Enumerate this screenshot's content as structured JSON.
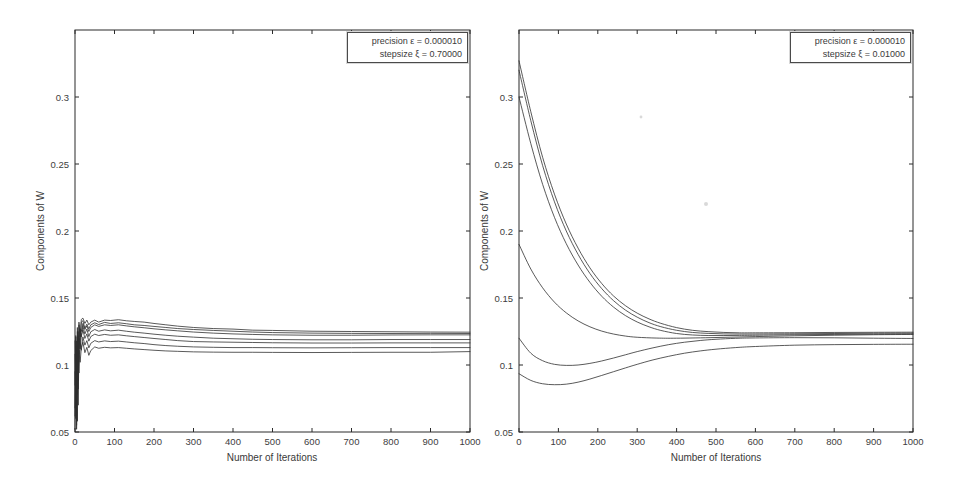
{
  "figure": {
    "background": "#ffffff",
    "colors": {
      "line": "#2e2e2e",
      "frame": "#2b2b2b",
      "text": "#3a3a3a",
      "legend_border": "#4a4a4a"
    },
    "scan_specks": [
      {
        "x": 641,
        "y": 117,
        "r": 1.4
      },
      {
        "x": 706,
        "y": 204,
        "r": 2.0
      }
    ]
  },
  "chart_data": [
    {
      "type": "line",
      "title": "",
      "xlabel": "Number of Iterations",
      "ylabel": "Components of W",
      "xlim": [
        0,
        1000
      ],
      "ylim": [
        0.05,
        0.35
      ],
      "grid": false,
      "smooth": false,
      "legend_position": "top-right",
      "legend_lines": [
        "precision ε = 0.000010",
        "stepsize ξ = 0.70000"
      ],
      "xticks": [
        0,
        100,
        200,
        300,
        400,
        500,
        600,
        700,
        800,
        900,
        1000
      ],
      "yticks": [
        0.05,
        0.1,
        0.15,
        0.2,
        0.25,
        0.3
      ],
      "ytick_labels": [
        "0.05",
        "0.1",
        "0.15",
        "0.2",
        "0.25",
        "0.3"
      ],
      "series_x": [
        0,
        2,
        4,
        6,
        8,
        10,
        13,
        16,
        20,
        25,
        30,
        35,
        40,
        50,
        60,
        75,
        90,
        110,
        130,
        150,
        175,
        200,
        230,
        260,
        300,
        350,
        400,
        450,
        500,
        600,
        700,
        800,
        900,
        1000
      ],
      "series": [
        {
          "name": "w1",
          "values": [
            0.068,
            0.122,
            0.055,
            0.128,
            0.096,
            0.132,
            0.121,
            0.134,
            0.135,
            0.131,
            0.1335,
            0.13,
            0.132,
            0.1335,
            0.132,
            0.1335,
            0.1332,
            0.1338,
            0.133,
            0.1325,
            0.132,
            0.131,
            0.13,
            0.129,
            0.128,
            0.1272,
            0.1268,
            0.126,
            0.1258,
            0.1252,
            0.125,
            0.1248,
            0.1246,
            0.1245
          ]
        },
        {
          "name": "w2",
          "values": [
            0.052,
            0.114,
            0.07,
            0.125,
            0.088,
            0.13,
            0.117,
            0.132,
            0.133,
            0.1275,
            0.1305,
            0.127,
            0.13,
            0.1315,
            0.1302,
            0.1318,
            0.131,
            0.1315,
            0.1308,
            0.13,
            0.1295,
            0.1288,
            0.128,
            0.1272,
            0.1265,
            0.1258,
            0.1252,
            0.1246,
            0.1242,
            0.1238,
            0.1236,
            0.1235,
            0.1236,
            0.1235
          ]
        },
        {
          "name": "w3",
          "values": [
            0.095,
            0.06,
            0.11,
            0.078,
            0.122,
            0.108,
            0.127,
            0.125,
            0.131,
            0.1265,
            0.1292,
            0.125,
            0.128,
            0.13,
            0.1288,
            0.13,
            0.1295,
            0.13,
            0.1292,
            0.1285,
            0.1278,
            0.127,
            0.1262,
            0.1255,
            0.1246,
            0.1238,
            0.1232,
            0.1228,
            0.1225,
            0.1222,
            0.1222,
            0.1224,
            0.1225,
            0.1225
          ]
        },
        {
          "name": "w4",
          "values": [
            0.108,
            0.076,
            0.118,
            0.088,
            0.125,
            0.112,
            0.126,
            0.121,
            0.129,
            0.1232,
            0.1268,
            0.1212,
            0.1248,
            0.1265,
            0.1252,
            0.1262,
            0.1255,
            0.126,
            0.1252,
            0.1245,
            0.1238,
            0.123,
            0.1222,
            0.1215,
            0.1208,
            0.12,
            0.1196,
            0.1192,
            0.119,
            0.1188,
            0.1188,
            0.119,
            0.119,
            0.119
          ]
        },
        {
          "name": "w5",
          "values": [
            0.085,
            0.121,
            0.062,
            0.115,
            0.082,
            0.12,
            0.112,
            0.122,
            0.1262,
            0.1198,
            0.1232,
            0.1178,
            0.1212,
            0.123,
            0.122,
            0.1228,
            0.1222,
            0.1225,
            0.1218,
            0.1212,
            0.1205,
            0.1198,
            0.119,
            0.1182,
            0.1175,
            0.1172,
            0.117,
            0.1168,
            0.1166,
            0.1164,
            0.1164,
            0.1165,
            0.1165,
            0.1165
          ]
        },
        {
          "name": "w6",
          "values": [
            0.118,
            0.068,
            0.112,
            0.058,
            0.108,
            0.094,
            0.117,
            0.111,
            0.121,
            0.1148,
            0.1182,
            0.1128,
            0.1162,
            0.1182,
            0.1172,
            0.118,
            0.1175,
            0.1178,
            0.1172,
            0.1166,
            0.116,
            0.1152,
            0.1145,
            0.114,
            0.1135,
            0.1132,
            0.113,
            0.113,
            0.1129,
            0.1128,
            0.1129,
            0.113,
            0.113,
            0.113
          ]
        },
        {
          "name": "w7",
          "values": [
            0.062,
            0.106,
            0.052,
            0.098,
            0.07,
            0.111,
            0.102,
            0.113,
            0.117,
            0.1092,
            0.1132,
            0.1072,
            0.1108,
            0.1135,
            0.1125,
            0.1132,
            0.1128,
            0.113,
            0.1125,
            0.112,
            0.1115,
            0.111,
            0.1105,
            0.1102,
            0.1098,
            0.1096,
            0.1095,
            0.1095,
            0.1094,
            0.1093,
            0.1094,
            0.1095,
            0.1095,
            0.11
          ]
        }
      ]
    },
    {
      "type": "line",
      "title": "",
      "xlabel": "Number of Iterations",
      "ylabel": "Components of W",
      "xlim": [
        0,
        1000
      ],
      "ylim": [
        0.05,
        0.35
      ],
      "grid": false,
      "smooth": true,
      "legend_position": "top-right",
      "legend_lines": [
        "precision ε = 0.000010",
        "stepsize ξ = 0.01000"
      ],
      "xticks": [
        0,
        100,
        200,
        300,
        400,
        500,
        600,
        700,
        800,
        900,
        1000
      ],
      "yticks": [
        0.05,
        0.1,
        0.15,
        0.2,
        0.25,
        0.3
      ],
      "ytick_labels": [
        "0.05",
        "0.1",
        "0.15",
        "0.2",
        "0.25",
        "0.3"
      ],
      "series": [
        {
          "name": "w1",
          "points": [
            [
              0,
              0.327
            ],
            [
              30,
              0.289
            ],
            [
              60,
              0.255
            ],
            [
              90,
              0.2275
            ],
            [
              120,
              0.2052
            ],
            [
              150,
              0.1872
            ],
            [
              180,
              0.1725
            ],
            [
              210,
              0.1608
            ],
            [
              240,
              0.1515
            ],
            [
              270,
              0.1443
            ],
            [
              300,
              0.1387
            ],
            [
              330,
              0.1344
            ],
            [
              360,
              0.1311
            ],
            [
              400,
              0.1279
            ],
            [
              440,
              0.1259
            ],
            [
              480,
              0.1249
            ],
            [
              520,
              0.1243
            ],
            [
              560,
              0.124
            ],
            [
              600,
              0.124
            ],
            [
              700,
              0.1241
            ],
            [
              800,
              0.1243
            ],
            [
              900,
              0.1244
            ],
            [
              1000,
              0.1245
            ]
          ]
        },
        {
          "name": "w2",
          "points": [
            [
              0,
              0.32
            ],
            [
              30,
              0.2823
            ],
            [
              60,
              0.2488
            ],
            [
              90,
              0.2218
            ],
            [
              120,
              0.2
            ],
            [
              150,
              0.1825
            ],
            [
              180,
              0.1683
            ],
            [
              210,
              0.157
            ],
            [
              240,
              0.148
            ],
            [
              270,
              0.141
            ],
            [
              300,
              0.1357
            ],
            [
              330,
              0.1316
            ],
            [
              360,
              0.1286
            ],
            [
              400,
              0.1259
            ],
            [
              440,
              0.1243
            ],
            [
              480,
              0.1236
            ],
            [
              520,
              0.1232
            ],
            [
              560,
              0.1231
            ],
            [
              600,
              0.1231
            ],
            [
              700,
              0.1233
            ],
            [
              800,
              0.1235
            ],
            [
              900,
              0.1237
            ],
            [
              1000,
              0.1238
            ]
          ]
        },
        {
          "name": "w3",
          "points": [
            [
              0,
              0.3
            ],
            [
              30,
              0.2652
            ],
            [
              60,
              0.2348
            ],
            [
              90,
              0.2102
            ],
            [
              120,
              0.1905
            ],
            [
              150,
              0.1746
            ],
            [
              180,
              0.1617
            ],
            [
              210,
              0.1513
            ],
            [
              240,
              0.1432
            ],
            [
              270,
              0.1369
            ],
            [
              300,
              0.1321
            ],
            [
              330,
              0.1285
            ],
            [
              360,
              0.1258
            ],
            [
              400,
              0.1235
            ],
            [
              440,
              0.1224
            ],
            [
              480,
              0.122
            ],
            [
              520,
              0.122
            ],
            [
              560,
              0.1221
            ],
            [
              600,
              0.1222
            ],
            [
              700,
              0.1226
            ],
            [
              800,
              0.1228
            ],
            [
              900,
              0.123
            ],
            [
              1000,
              0.1232
            ]
          ]
        },
        {
          "name": "w4",
          "points": [
            [
              0,
              0.19
            ],
            [
              30,
              0.1716
            ],
            [
              60,
              0.1576
            ],
            [
              90,
              0.1469
            ],
            [
              120,
              0.1389
            ],
            [
              150,
              0.1329
            ],
            [
              180,
              0.1285
            ],
            [
              210,
              0.1253
            ],
            [
              240,
              0.1231
            ],
            [
              270,
              0.1216
            ],
            [
              300,
              0.1207
            ],
            [
              350,
              0.1201
            ],
            [
              400,
              0.12
            ],
            [
              500,
              0.1205
            ],
            [
              600,
              0.1212
            ],
            [
              700,
              0.1218
            ],
            [
              800,
              0.1222
            ],
            [
              900,
              0.1226
            ],
            [
              1000,
              0.1228
            ]
          ]
        },
        {
          "name": "w5",
          "points": [
            [
              0,
              0.12
            ],
            [
              30,
              0.1088
            ],
            [
              60,
              0.1032
            ],
            [
              90,
              0.1005
            ],
            [
              120,
              0.0997
            ],
            [
              150,
              0.1
            ],
            [
              180,
              0.1012
            ],
            [
              210,
              0.103
            ],
            [
              240,
              0.1052
            ],
            [
              270,
              0.1076
            ],
            [
              300,
              0.11
            ],
            [
              340,
              0.1128
            ],
            [
              380,
              0.1152
            ],
            [
              420,
              0.117
            ],
            [
              460,
              0.1183
            ],
            [
              500,
              0.1192
            ],
            [
              550,
              0.1199
            ],
            [
              600,
              0.1202
            ],
            [
              700,
              0.1204
            ],
            [
              800,
              0.1203
            ],
            [
              900,
              0.12
            ],
            [
              1000,
              0.1198
            ]
          ]
        },
        {
          "name": "w6",
          "points": [
            [
              0,
              0.0935
            ],
            [
              30,
              0.0885
            ],
            [
              60,
              0.086
            ],
            [
              90,
              0.0853
            ],
            [
              120,
              0.0857
            ],
            [
              150,
              0.0872
            ],
            [
              180,
              0.0895
            ],
            [
              210,
              0.0922
            ],
            [
              240,
              0.095
            ],
            [
              270,
              0.0978
            ],
            [
              300,
              0.1005
            ],
            [
              340,
              0.1038
            ],
            [
              380,
              0.1065
            ],
            [
              420,
              0.1088
            ],
            [
              460,
              0.1105
            ],
            [
              500,
              0.1118
            ],
            [
              550,
              0.113
            ],
            [
              600,
              0.1138
            ],
            [
              700,
              0.1148
            ],
            [
              800,
              0.1152
            ],
            [
              900,
              0.1154
            ],
            [
              1000,
              0.1155
            ]
          ]
        }
      ]
    }
  ]
}
